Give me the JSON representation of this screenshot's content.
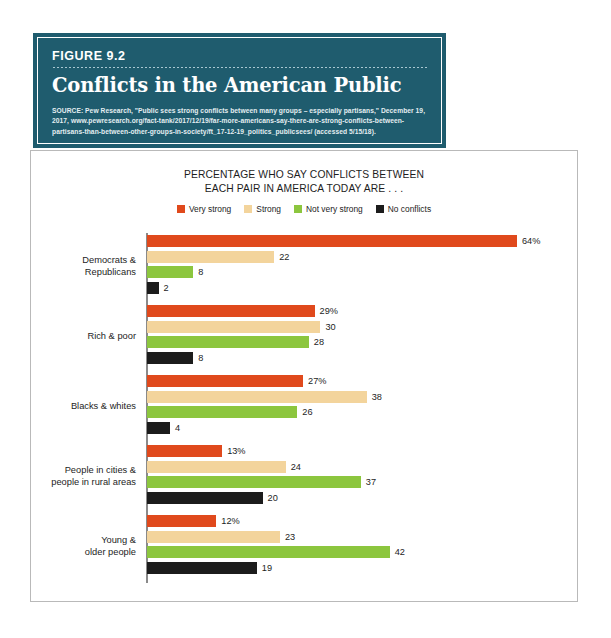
{
  "figure": {
    "number_label": "FIGURE 9.2",
    "title": "Conflicts in the American Public",
    "source": "SOURCE: Pew Research, \"Public sees strong conflicts between many groups – especially partisans,\" December 19, 2017, www.pewresearch.org/fact-tank/2017/12/19/far-more-americans-say-there-are-strong-conflicts-between-partisans-than-between-other-groups-in-society/ft_17-12-19_politics_publicsees/ (accessed 5/15/18).",
    "banner_color": "#1f5c6e"
  },
  "chart_data": {
    "type": "bar",
    "orientation": "horizontal",
    "title_line1": "PERCENTAGE WHO SAY CONFLICTS BETWEEN",
    "title_line2": "EACH PAIR IN AMERICA TODAY ARE . . .",
    "xlabel": "",
    "ylabel": "",
    "xlim": [
      0,
      64
    ],
    "grid": false,
    "legend_position": "top-center",
    "categories": [
      "Democrats & Republicans",
      "Rich & poor",
      "Blacks & whites",
      "People in cities & people in rural areas",
      "Young & older people"
    ],
    "category_lines": [
      [
        "Democrats &",
        "Republicans"
      ],
      [
        "Rich & poor"
      ],
      [
        "Blacks & whites"
      ],
      [
        "People in cities &",
        "people in rural areas"
      ],
      [
        "Young &",
        "older people"
      ]
    ],
    "series": [
      {
        "name": "Very strong",
        "color": "#e0491c",
        "values": [
          64,
          29,
          27,
          13,
          12
        ],
        "labels": [
          "64%",
          "29%",
          "27%",
          "13%",
          "12%"
        ]
      },
      {
        "name": "Strong",
        "color": "#f3d49c",
        "values": [
          22,
          30,
          38,
          24,
          23
        ],
        "labels": [
          "22",
          "30",
          "38",
          "24",
          "23"
        ]
      },
      {
        "name": "Not very strong",
        "color": "#8cc63e",
        "values": [
          8,
          28,
          26,
          37,
          42
        ],
        "labels": [
          "8",
          "28",
          "26",
          "37",
          "42"
        ]
      },
      {
        "name": "No conflicts",
        "color": "#1c1c1c",
        "values": [
          2,
          8,
          4,
          20,
          19
        ],
        "labels": [
          "2",
          "8",
          "4",
          "20",
          "19"
        ]
      }
    ]
  }
}
